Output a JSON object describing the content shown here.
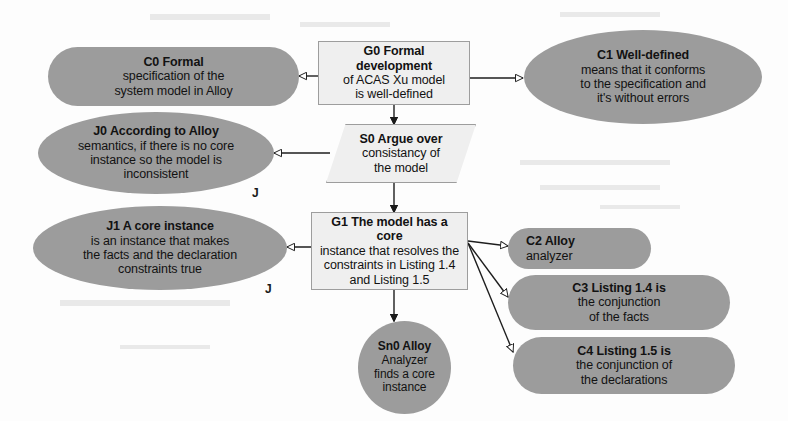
{
  "diagram": {
    "type": "gsn-assurance-case",
    "background_color": "#fdfdfd",
    "node_fill_gray": "#9c9c9c",
    "node_fill_light": "#efefef",
    "nodes": [
      {
        "id": "C0",
        "shape": "pill",
        "fill": "gray",
        "prefix": "C0",
        "text": "Formal specification of the system model  in Alloy",
        "line1": "C0 Formal",
        "line2": "specification of the",
        "line3": "system model  in Alloy"
      },
      {
        "id": "G0",
        "shape": "rectangle",
        "fill": "light",
        "prefix": "G0",
        "text": "Formal development of ACAS Xu model is well-defined",
        "line1": "G0  Formal development",
        "line2": "of ACAS Xu model",
        "line3": "is well-defined"
      },
      {
        "id": "C1",
        "shape": "ellipse",
        "fill": "gray",
        "prefix": "C1",
        "text": "Well-defined means that it conforms to the specification and it's without errors",
        "line1": "C1 Well-defined",
        "line2": "means that it conforms",
        "line3": "to the specification and",
        "line4": "it's without errors"
      },
      {
        "id": "J0",
        "shape": "ellipse",
        "fill": "gray",
        "prefix": "J0",
        "text": "According to Alloy semantics, if there is no core instance so the model is inconsistent",
        "line1": "J0 According to Alloy",
        "line2": "semantics, if there is no core",
        "line3": "instance so the model is",
        "line4": "inconsistent"
      },
      {
        "id": "S0",
        "shape": "parallelogram",
        "fill": "light",
        "prefix": "S0",
        "text": "Argue over consistancy of the model",
        "line1": "S0 Argue over",
        "line2": "consistancy of",
        "line3": "the model"
      },
      {
        "id": "J1",
        "shape": "ellipse",
        "fill": "gray",
        "prefix": "J1",
        "text": "A core instance is an instance that makes the facts and the declaration constraints true",
        "line1": "J1 A core instance",
        "line2": "is an instance that makes",
        "line3": "the facts and the declaration",
        "line4": "constraints true"
      },
      {
        "id": "G1",
        "shape": "rectangle",
        "fill": "light",
        "prefix": "G1",
        "text": "The model has a core instance  that resolves the constraints in Listing 1.4 and Listing 1.5",
        "line1": "G1  The model has a core",
        "line2": "instance  that resolves the",
        "line3": "constraints in Listing 1.4",
        "line4": "and Listing 1.5"
      },
      {
        "id": "C2",
        "shape": "pill",
        "fill": "gray",
        "prefix": "C2",
        "text": "Alloy analyzer",
        "line1": "C2 Alloy",
        "line2": "analyzer"
      },
      {
        "id": "C3",
        "shape": "pill",
        "fill": "gray",
        "prefix": "C3",
        "text": "Listing 1.4 is the conjunction of the facts",
        "line1": "C3 Listing 1.4 is",
        "line2": "the conjunction",
        "line3": "of the facts"
      },
      {
        "id": "C4",
        "shape": "pill",
        "fill": "gray",
        "prefix": "C4",
        "text": "Listing 1.5 is the conjunction of the declarations",
        "line1": "C4 Listing 1.5 is",
        "line2": "the conjunction of",
        "line3": "the declarations"
      },
      {
        "id": "Sn0",
        "shape": "circle",
        "fill": "gray",
        "prefix": "Sn0",
        "text": "Alloy Analyzer finds a core instance",
        "line1": "Sn0 Alloy",
        "line2": "Analyzer",
        "line3": "finds a core",
        "line4": "instance"
      }
    ],
    "annotations": [
      {
        "id": "j-marker-0",
        "label": "J"
      },
      {
        "id": "j-marker-1",
        "label": "J"
      }
    ],
    "edges": [
      {
        "from": "G0",
        "to": "C0",
        "head": "hollow"
      },
      {
        "from": "G0",
        "to": "C1",
        "head": "hollow"
      },
      {
        "from": "G0",
        "to": "S0",
        "head": "solid"
      },
      {
        "from": "S0",
        "to": "J0",
        "head": "hollow"
      },
      {
        "from": "S0",
        "to": "G1",
        "head": "solid"
      },
      {
        "from": "G1",
        "to": "J1",
        "head": "hollow"
      },
      {
        "from": "G1",
        "to": "C2",
        "head": "hollow"
      },
      {
        "from": "G1",
        "to": "C3",
        "head": "hollow"
      },
      {
        "from": "G1",
        "to": "C4",
        "head": "hollow"
      },
      {
        "from": "G1",
        "to": "Sn0",
        "head": "solid"
      }
    ]
  }
}
